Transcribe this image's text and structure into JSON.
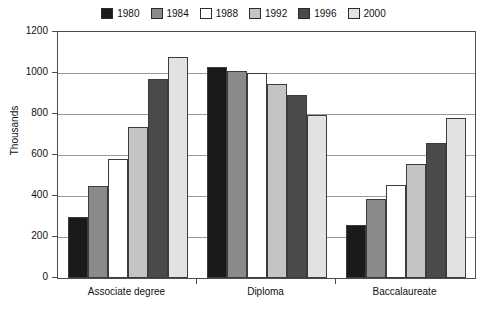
{
  "chart_data": {
    "type": "bar",
    "title": "",
    "xlabel": "",
    "ylabel": "Thousands",
    "ylim": [
      0,
      1200
    ],
    "yticks": [
      0,
      200,
      400,
      600,
      800,
      1000,
      1200
    ],
    "ytick_labels": [
      "0",
      "200",
      "400",
      "600",
      "800",
      "1000",
      "1200"
    ],
    "grid": true,
    "legend_position": "top-center",
    "categories": [
      "Associate degree",
      "Diploma",
      "Baccalaureate"
    ],
    "series": [
      {
        "name": "1980",
        "color": "#1a1a1a",
        "values": [
          300,
          1030,
          260
        ]
      },
      {
        "name": "1984",
        "color": "#8a8a8a",
        "values": [
          450,
          1010,
          385
        ]
      },
      {
        "name": "1988",
        "color": "#ffffff",
        "values": [
          580,
          1000,
          455
        ]
      },
      {
        "name": "1992",
        "color": "#c4c4c4",
        "values": [
          735,
          945,
          555
        ]
      },
      {
        "name": "1996",
        "color": "#4a4a4a",
        "values": [
          970,
          895,
          660
        ]
      },
      {
        "name": "2000",
        "color": "#e2e2e2",
        "values": [
          1080,
          795,
          780
        ]
      }
    ]
  }
}
